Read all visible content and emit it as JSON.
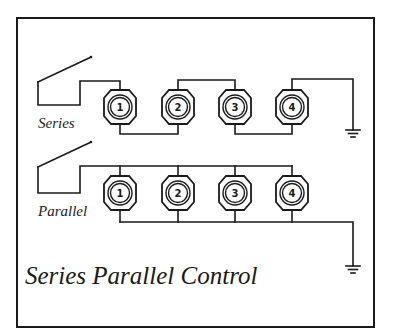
{
  "title": "Series Parallel Control",
  "colors": {
    "ink": "#1a1a1a",
    "background": "#ffffff"
  },
  "circuits": {
    "series": {
      "label": "Series",
      "lamps": [
        "1",
        "2",
        "3",
        "4"
      ]
    },
    "parallel": {
      "label": "Parallel",
      "lamps": [
        "1",
        "2",
        "3",
        "4"
      ]
    }
  },
  "symbols": {
    "switch": "switch-icon",
    "ground": "ground-icon",
    "lamp": "lamp-icon"
  }
}
